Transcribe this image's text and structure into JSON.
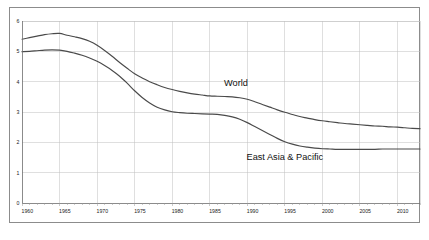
{
  "chart_data": {
    "type": "line",
    "title": "",
    "subtitle": "",
    "xlabel": "",
    "ylabel": "",
    "xlim": [
      1960,
      2013
    ],
    "ylim": [
      0,
      6
    ],
    "grid": true,
    "legend_position": "inline-annotations",
    "x_tick_labels": [
      "1960",
      "1965",
      "1970",
      "1975",
      "1980",
      "1985",
      "1990",
      "1995",
      "2000",
      "2005",
      "2010"
    ],
    "x_ticks": [
      1960,
      1965,
      1970,
      1975,
      1980,
      1985,
      1990,
      1995,
      2000,
      2005,
      2010
    ],
    "y_tick_labels": [
      "0",
      "1",
      "2",
      "3",
      "4",
      "5",
      "6"
    ],
    "y_ticks": [
      0,
      1,
      2,
      3,
      4,
      5,
      6
    ],
    "minor_x_tick_step": 1,
    "annotations": [
      {
        "text": "World",
        "x": 1988.5,
        "y": 3.85
      },
      {
        "text": "East Asia & Pacific",
        "x": 1995.0,
        "y": 1.42
      }
    ],
    "series": [
      {
        "name": "World",
        "color": "#4a4a4a",
        "x": [
          1960,
          1961,
          1962,
          1963,
          1964,
          1965,
          1966,
          1967,
          1968,
          1969,
          1970,
          1971,
          1972,
          1973,
          1974,
          1975,
          1976,
          1977,
          1978,
          1979,
          1980,
          1981,
          1982,
          1983,
          1984,
          1985,
          1986,
          1987,
          1988,
          1989,
          1990,
          1991,
          1992,
          1993,
          1994,
          1995,
          1996,
          1997,
          1998,
          1999,
          2000,
          2001,
          2002,
          2003,
          2004,
          2005,
          2006,
          2007,
          2008,
          2009,
          2010,
          2011,
          2012,
          2013
        ],
        "values": [
          5.4,
          5.45,
          5.5,
          5.55,
          5.58,
          5.59,
          5.53,
          5.48,
          5.42,
          5.33,
          5.2,
          5.03,
          4.84,
          4.63,
          4.44,
          4.26,
          4.12,
          4.0,
          3.9,
          3.81,
          3.74,
          3.68,
          3.63,
          3.59,
          3.56,
          3.53,
          3.52,
          3.51,
          3.5,
          3.47,
          3.42,
          3.34,
          3.25,
          3.16,
          3.07,
          2.99,
          2.92,
          2.85,
          2.8,
          2.75,
          2.71,
          2.68,
          2.65,
          2.62,
          2.6,
          2.58,
          2.56,
          2.54,
          2.53,
          2.51,
          2.5,
          2.48,
          2.46,
          2.45
        ]
      },
      {
        "name": "East Asia & Pacific",
        "color": "#4a4a4a",
        "x": [
          1960,
          1961,
          1962,
          1963,
          1964,
          1965,
          1966,
          1967,
          1968,
          1969,
          1970,
          1971,
          1972,
          1973,
          1974,
          1975,
          1976,
          1977,
          1978,
          1979,
          1980,
          1981,
          1982,
          1983,
          1984,
          1985,
          1986,
          1987,
          1988,
          1989,
          1990,
          1991,
          1992,
          1993,
          1994,
          1995,
          1996,
          1997,
          1998,
          1999,
          2000,
          2001,
          2002,
          2003,
          2004,
          2005,
          2006,
          2007,
          2008,
          2009,
          2010,
          2011,
          2012,
          2013
        ],
        "values": [
          4.99,
          5.0,
          5.02,
          5.04,
          5.05,
          5.04,
          5.0,
          4.94,
          4.87,
          4.78,
          4.67,
          4.53,
          4.37,
          4.18,
          3.95,
          3.7,
          3.48,
          3.3,
          3.16,
          3.07,
          3.01,
          2.98,
          2.96,
          2.95,
          2.94,
          2.93,
          2.92,
          2.89,
          2.84,
          2.76,
          2.65,
          2.52,
          2.39,
          2.26,
          2.13,
          2.02,
          1.94,
          1.88,
          1.84,
          1.81,
          1.79,
          1.78,
          1.77,
          1.77,
          1.77,
          1.77,
          1.77,
          1.77,
          1.78,
          1.78,
          1.78,
          1.78,
          1.78,
          1.78
        ]
      }
    ]
  }
}
